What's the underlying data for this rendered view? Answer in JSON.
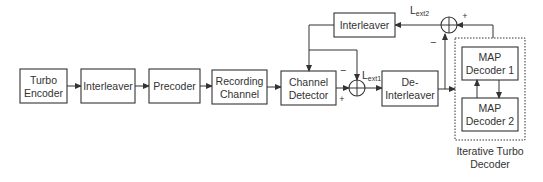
{
  "diagram": {
    "blocks": {
      "turbo_encoder": [
        "Turbo",
        "Encoder"
      ],
      "interleaver1": [
        "Interleaver"
      ],
      "precoder": [
        "Precoder"
      ],
      "recording_channel": [
        "Recording",
        "Channel"
      ],
      "channel_detector": [
        "Channel",
        "Detector"
      ],
      "deinterleaver": [
        "De-",
        "Interleaver"
      ],
      "interleaver2": [
        "Interleaver"
      ],
      "map_decoder1": [
        "MAP",
        "Decoder 1"
      ],
      "map_decoder2": [
        "MAP",
        "Decoder 2"
      ]
    },
    "group_label": [
      "Iterative Turbo",
      "Decoder"
    ],
    "signals": {
      "lext1_main": "L",
      "lext1_sub": "ext1",
      "lext2_main": "L",
      "lext2_sub": "ext2"
    },
    "signs": {
      "sum1_top": "−",
      "sum1_left": "+",
      "sum2_right": "+",
      "sum2_bottom": "−"
    }
  }
}
